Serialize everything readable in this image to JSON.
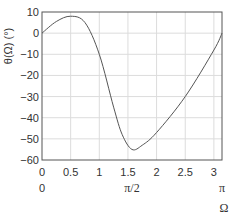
{
  "chart_data": {
    "type": "line",
    "title": "",
    "xlabel": "Ω",
    "ylabel": "θ(Ω) (°)",
    "xlim": [
      0,
      3.1416
    ],
    "ylim": [
      -60,
      10
    ],
    "grid": true,
    "x_ticks": [
      "0",
      "0.5",
      "1",
      "1.5",
      "2",
      "2.5",
      "3"
    ],
    "x_ticks_secondary": [
      {
        "pos": 0,
        "label": "0"
      },
      {
        "pos": 1.5708,
        "label": "π/2"
      },
      {
        "pos": 3.1416,
        "label": "π"
      }
    ],
    "y_ticks": [
      "10",
      "0",
      "−10",
      "−20",
      "−30",
      "−40",
      "−50",
      "−60"
    ],
    "series": [
      {
        "name": "θ(Ω)",
        "color": "#555555",
        "x": [
          0,
          0.25,
          0.5,
          0.75,
          1.0,
          1.25,
          1.4,
          1.57,
          1.75,
          2.0,
          2.5,
          3.0,
          3.1416
        ],
        "y": [
          0,
          5.5,
          8,
          5,
          -10,
          -35,
          -48,
          -55,
          -53,
          -47,
          -30,
          -8,
          0
        ]
      }
    ]
  }
}
